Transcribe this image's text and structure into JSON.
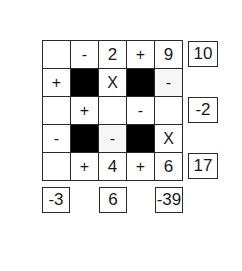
{
  "puzzle": {
    "rows": 5,
    "cols": 5,
    "cells": [
      [
        {
          "value": "",
          "type": "empty"
        },
        {
          "value": "-",
          "type": "operator"
        },
        {
          "value": "2",
          "type": "number"
        },
        {
          "value": "+",
          "type": "operator"
        },
        {
          "value": "9",
          "type": "number"
        }
      ],
      [
        {
          "value": "+",
          "type": "operator"
        },
        {
          "value": "",
          "type": "blocked"
        },
        {
          "value": "X",
          "type": "operator"
        },
        {
          "value": "",
          "type": "blocked"
        },
        {
          "value": "-",
          "type": "operator"
        }
      ],
      [
        {
          "value": "",
          "type": "empty"
        },
        {
          "value": "+",
          "type": "operator"
        },
        {
          "value": "",
          "type": "empty"
        },
        {
          "value": "-",
          "type": "operator"
        },
        {
          "value": "",
          "type": "empty"
        }
      ],
      [
        {
          "value": "-",
          "type": "operator"
        },
        {
          "value": "",
          "type": "blocked"
        },
        {
          "value": "-",
          "type": "operator"
        },
        {
          "value": "",
          "type": "blocked"
        },
        {
          "value": "X",
          "type": "operator"
        }
      ],
      [
        {
          "value": "",
          "type": "empty"
        },
        {
          "value": "+",
          "type": "operator"
        },
        {
          "value": "4",
          "type": "number"
        },
        {
          "value": "+",
          "type": "operator"
        },
        {
          "value": "6",
          "type": "number"
        }
      ]
    ],
    "row_results": [
      {
        "row": 0,
        "value": "10"
      },
      {
        "row": 2,
        "value": "-2"
      },
      {
        "row": 4,
        "value": "17"
      }
    ],
    "col_results": [
      {
        "col": 0,
        "value": "-3"
      },
      {
        "col": 2,
        "value": "6"
      },
      {
        "col": 4,
        "value": "-39"
      }
    ]
  }
}
